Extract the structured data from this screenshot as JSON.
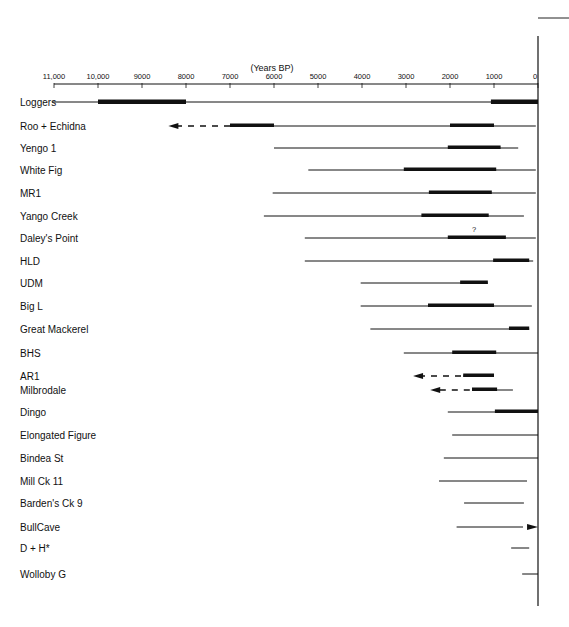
{
  "chart_data": {
    "type": "range_timeline",
    "title": "",
    "xlabel": "(Years BP)",
    "ylabel": "",
    "xlim": [
      11000,
      0
    ],
    "x_ticks": [
      "11,000",
      "10,000",
      "9000",
      "8000",
      "7000",
      "6000",
      "5000",
      "4000",
      "3000",
      "2000",
      "1000",
      "0"
    ],
    "x_tick_values": [
      11000,
      10000,
      9000,
      8000,
      7000,
      6000,
      5000,
      4000,
      3000,
      2000,
      1000,
      0
    ],
    "grid": false,
    "legend": null,
    "series": [
      {
        "site": "Loggers",
        "y": 102,
        "line": [
          11000,
          0
        ],
        "thick": [
          [
            10000,
            8000
          ],
          [
            1070,
            0
          ]
        ],
        "extends_back_arrow": null,
        "forward_arrow": false,
        "note": ""
      },
      {
        "site": "Roo + Echidna",
        "y": 126,
        "line": [
          6000,
          50
        ],
        "thick": [
          [
            7000,
            6000
          ],
          [
            2000,
            1000
          ]
        ],
        "extends_back_arrow": {
          "from": 7000,
          "to": 8400
        },
        "forward_arrow": false,
        "note": ""
      },
      {
        "site": "Yengo 1",
        "y": 148,
        "line": [
          6000,
          450
        ],
        "thick": [
          [
            2050,
            850
          ]
        ],
        "extends_back_arrow": null,
        "forward_arrow": false,
        "note": ""
      },
      {
        "site": "White Fig",
        "y": 170,
        "line": [
          5220,
          50
        ],
        "thick": [
          [
            3050,
            950
          ]
        ],
        "extends_back_arrow": null,
        "forward_arrow": false,
        "note": ""
      },
      {
        "site": "MR1",
        "y": 193,
        "line": [
          6030,
          50
        ],
        "thick": [
          [
            2480,
            1050
          ]
        ],
        "extends_back_arrow": null,
        "forward_arrow": false,
        "note": ""
      },
      {
        "site": "Yango Creek",
        "y": 216,
        "line": [
          6230,
          320
        ],
        "thick": [
          [
            2650,
            1120
          ]
        ],
        "extends_back_arrow": null,
        "forward_arrow": false,
        "note": ""
      },
      {
        "site": "Daley's Point",
        "y": 238,
        "line": [
          5300,
          50
        ],
        "thick": [
          [
            2050,
            730
          ]
        ],
        "extends_back_arrow": null,
        "forward_arrow": false,
        "note": "?"
      },
      {
        "site": "HLD",
        "y": 261,
        "line": [
          5300,
          110
        ],
        "thick": [
          [
            1020,
            200
          ]
        ],
        "extends_back_arrow": null,
        "forward_arrow": false,
        "note": ""
      },
      {
        "site": "UDM",
        "y": 283,
        "line": [
          4030,
          1140
        ],
        "thick": [
          [
            1770,
            1140
          ]
        ],
        "extends_back_arrow": null,
        "forward_arrow": false,
        "note": ""
      },
      {
        "site": "Big L",
        "y": 306,
        "line": [
          4030,
          140
        ],
        "thick": [
          [
            2500,
            1000
          ]
        ],
        "extends_back_arrow": null,
        "forward_arrow": false,
        "note": ""
      },
      {
        "site": "Great Mackerel",
        "y": 329,
        "line": [
          3810,
          200
        ],
        "thick": [
          [
            660,
            200
          ]
        ],
        "extends_back_arrow": null,
        "forward_arrow": false,
        "note": ""
      },
      {
        "site": "BHS",
        "y": 353,
        "line": [
          3050,
          0
        ],
        "thick": [
          [
            1950,
            950
          ]
        ],
        "extends_back_arrow": null,
        "forward_arrow": false,
        "note": ""
      },
      {
        "site": "AR1",
        "y": 376,
        "line": [
          1700,
          1000
        ],
        "thick": [
          [
            1700,
            1000
          ]
        ],
        "extends_back_arrow": {
          "from": 1750,
          "to": 2840
        },
        "forward_arrow": false,
        "note": ""
      },
      {
        "site": "Milbrodale",
        "y": 390,
        "line": [
          1500,
          570
        ],
        "thick": [
          [
            1500,
            930
          ]
        ],
        "extends_back_arrow": {
          "from": 1550,
          "to": 2450
        },
        "forward_arrow": false,
        "note": ""
      },
      {
        "site": "Dingo",
        "y": 412,
        "line": [
          2050,
          0
        ],
        "thick": [
          [
            980,
            0
          ]
        ],
        "extends_back_arrow": null,
        "forward_arrow": false,
        "note": ""
      },
      {
        "site": "Elongated Figure",
        "y": 435,
        "line": [
          1950,
          0
        ],
        "thick": [],
        "extends_back_arrow": null,
        "forward_arrow": false,
        "note": ""
      },
      {
        "site": "Bindea St",
        "y": 458,
        "line": [
          2140,
          0
        ],
        "thick": [],
        "extends_back_arrow": null,
        "forward_arrow": false,
        "note": ""
      },
      {
        "site": "Mill Ck 11",
        "y": 481,
        "line": [
          2250,
          250
        ],
        "thick": [],
        "extends_back_arrow": null,
        "forward_arrow": false,
        "note": ""
      },
      {
        "site": "Barden's Ck 9",
        "y": 503,
        "line": [
          1680,
          320
        ],
        "thick": [],
        "extends_back_arrow": null,
        "forward_arrow": false,
        "note": ""
      },
      {
        "site": "BullCave",
        "y": 527,
        "line": [
          1850,
          340
        ],
        "thick": [],
        "extends_back_arrow": null,
        "forward_arrow": true,
        "note": ""
      },
      {
        "site": "D + H*",
        "y": 548,
        "line": [
          610,
          200
        ],
        "thick": [],
        "extends_back_arrow": null,
        "forward_arrow": false,
        "note": ""
      },
      {
        "site": "Wolloby G",
        "y": 574,
        "line": [
          360,
          0
        ],
        "thick": [],
        "extends_back_arrow": null,
        "forward_arrow": false,
        "note": ""
      }
    ]
  },
  "axis": {
    "title": "(Years BP)",
    "ticks": [
      "11,000",
      "10,000",
      "9000",
      "8000",
      "7000",
      "6000",
      "5000",
      "4000",
      "3000",
      "2000",
      "1000",
      "0"
    ]
  },
  "sites": [
    {
      "label": "Loggers"
    },
    {
      "label": "Roo + Echidna"
    },
    {
      "label": "Yengo 1"
    },
    {
      "label": "White Fig"
    },
    {
      "label": "MR1"
    },
    {
      "label": "Yango Creek"
    },
    {
      "label": "Daley's Point"
    },
    {
      "label": "HLD"
    },
    {
      "label": "UDM"
    },
    {
      "label": "Big L"
    },
    {
      "label": "Great Mackerel"
    },
    {
      "label": "BHS"
    },
    {
      "label": "AR1"
    },
    {
      "label": "Milbrodale"
    },
    {
      "label": "Dingo"
    },
    {
      "label": "Elongated Figure"
    },
    {
      "label": "Bindea St"
    },
    {
      "label": "Mill Ck 11"
    },
    {
      "label": "Barden's Ck 9"
    },
    {
      "label": "BullCave"
    },
    {
      "label": "D + H*"
    },
    {
      "label": "Wolloby G"
    }
  ],
  "page_number_fragment": "",
  "colors": {
    "ink": "#111111",
    "background": "#ffffff"
  }
}
